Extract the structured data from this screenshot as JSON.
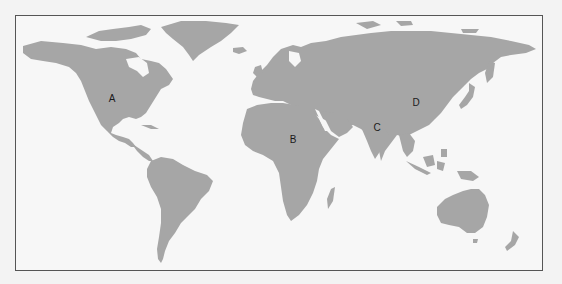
{
  "map": {
    "type": "world-political-outline",
    "land_color": "#a6a6a6",
    "ocean_color": "#f7f7f7",
    "border_color": "#555555",
    "markers": [
      {
        "id": "A",
        "label": "A",
        "region": "North America (central United States)",
        "x": 111,
        "y": 98
      },
      {
        "id": "B",
        "label": "B",
        "region": "Africa (central-east, near Sudan/Chad)",
        "x": 292,
        "y": 139
      },
      {
        "id": "C",
        "label": "C",
        "region": "South Asia (India)",
        "x": 376,
        "y": 127
      },
      {
        "id": "D",
        "label": "D",
        "region": "East Asia (China)",
        "x": 415,
        "y": 102
      }
    ]
  }
}
